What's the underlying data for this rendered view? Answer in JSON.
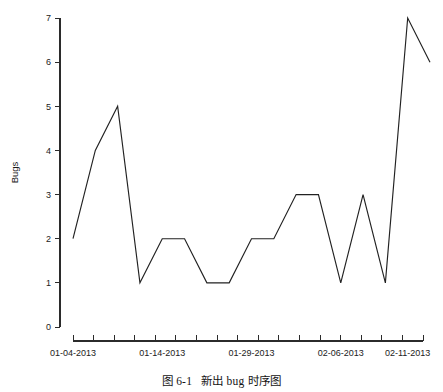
{
  "figure": {
    "title": "",
    "caption_number": "图 6-1",
    "caption_text": "新出 bug 时序图"
  },
  "chart_data": {
    "type": "line",
    "title": "",
    "xlabel": "",
    "ylabel": "Bugs",
    "ylim": [
      0,
      7
    ],
    "yticks": [
      0,
      1,
      2,
      3,
      4,
      5,
      6,
      7
    ],
    "ytick_labels": [
      "0",
      "1",
      "2",
      "3",
      "4",
      "5",
      "6",
      "7"
    ],
    "grid": false,
    "legend": false,
    "x_tick_labels": [
      "01-04-2013",
      "01-14-2013",
      "01-29-2013",
      "02-06-2013",
      "02-11-2013"
    ],
    "x_tick_label_indices": [
      0,
      4,
      8,
      12,
      15
    ],
    "x_minor_tick_count": 18,
    "categories": [
      "01-04-2013",
      "01-05-2013",
      "01-07-2013",
      "01-09-2013",
      "01-14-2013",
      "01-16-2013",
      "01-21-2013",
      "01-23-2013",
      "01-29-2013",
      "01-31-2013",
      "02-04-2013",
      "02-05-2013",
      "02-06-2013",
      "02-08-2013",
      "02-10-2013",
      "02-11-2013",
      "02-13-2013"
    ],
    "values": [
      2,
      4,
      5,
      1,
      2,
      2,
      1,
      1,
      2,
      2,
      3,
      3,
      1,
      3,
      1,
      7,
      6
    ],
    "series": [
      {
        "name": "Bugs",
        "color": "#222222",
        "values": [
          2,
          4,
          5,
          1,
          2,
          2,
          1,
          1,
          2,
          2,
          3,
          3,
          1,
          3,
          1,
          7,
          6
        ]
      }
    ]
  }
}
